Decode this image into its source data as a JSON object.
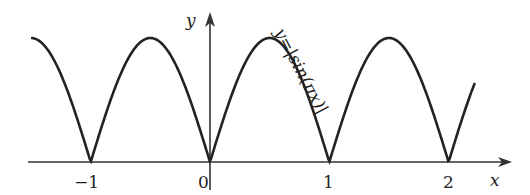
{
  "chart_data": {
    "type": "line",
    "title": "",
    "function_label": "y=|sin(πx)|",
    "xlabel": "x",
    "ylabel": "y",
    "x_ticks": [
      "−1",
      "0",
      "1",
      "2"
    ],
    "x_tick_values": [
      -1,
      0,
      1,
      2
    ],
    "xlim": [
      -1.5,
      2.22
    ],
    "ylim": [
      0,
      1
    ],
    "grid": false,
    "series": [
      {
        "name": "y=|sin(πx)|",
        "x": [
          -1.5,
          -1,
          -0.5,
          0,
          0.5,
          1,
          1.5,
          2,
          2.22
        ],
        "values": [
          1,
          0,
          1,
          0,
          1,
          0,
          1,
          0,
          0.64
        ]
      }
    ]
  },
  "labels": {
    "x_axis": "x",
    "y_axis": "y",
    "curve": "y=|sin(πx)|",
    "tick_m1": "−1",
    "tick_0": "0",
    "tick_1": "1",
    "tick_2": "2"
  }
}
